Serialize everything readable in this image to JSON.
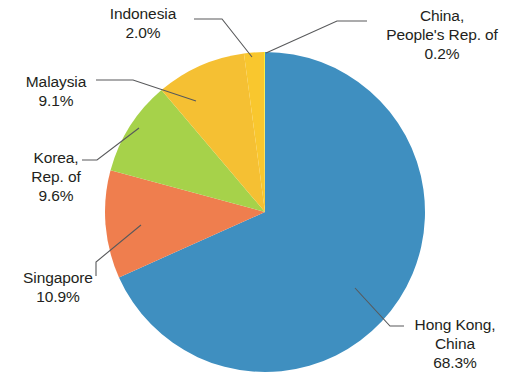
{
  "chart_data": {
    "type": "pie",
    "title": "",
    "subtitle": "",
    "xlabel": "",
    "ylabel": "",
    "legend_position": "none",
    "labels_position": "outside-with-leader-lines",
    "grid": false,
    "unit": "%",
    "categories": [
      "Hong Kong, China",
      "Singapore",
      "Korea, Rep. of",
      "Malaysia",
      "Indonesia",
      "China, People's Rep. of"
    ],
    "values": [
      68.3,
      10.9,
      9.6,
      9.1,
      2.0,
      0.2
    ],
    "colors": [
      "#3f8fc0",
      "#ef7e4e",
      "#a6d24a",
      "#f5c033",
      "#f9c72e",
      "#f8ec38"
    ],
    "slices": [
      {
        "name": "Hong Kong, China",
        "name_lines": [
          "Hong Kong,",
          "China"
        ],
        "value": 68.3,
        "value_label": "68.3%",
        "color": "#3f8fc0",
        "start_angle": 0.0,
        "end_angle": 245.88
      },
      {
        "name": "Singapore",
        "name_lines": [
          "Singapore"
        ],
        "value": 10.9,
        "value_label": "10.9%",
        "color": "#ef7e4e",
        "start_angle": 245.88,
        "end_angle": 285.12
      },
      {
        "name": "Korea, Rep. of",
        "name_lines": [
          "Korea,",
          "Rep. of"
        ],
        "value": 9.6,
        "value_label": "9.6%",
        "color": "#a6d24a",
        "start_angle": 285.12,
        "end_angle": 319.68
      },
      {
        "name": "Malaysia",
        "name_lines": [
          "Malaysia"
        ],
        "value": 9.1,
        "value_label": "9.1%",
        "color": "#f5c033",
        "start_angle": 319.68,
        "end_angle": 352.44
      },
      {
        "name": "Indonesia",
        "name_lines": [
          "Indonesia"
        ],
        "value": 2.0,
        "value_label": "2.0%",
        "color": "#f9c72e",
        "start_angle": 352.44,
        "end_angle": 359.64
      },
      {
        "name": "China, People's Rep. of",
        "name_lines": [
          "China,",
          "People's Rep. of"
        ],
        "value": 0.2,
        "value_label": "0.2%",
        "color": "#f8ec38",
        "start_angle": 359.64,
        "end_angle": 360.0
      }
    ]
  },
  "labels": {
    "indonesia": {
      "line1": "Indonesia",
      "pct": "2.0%"
    },
    "china": {
      "line1": "China,",
      "line2": "People's Rep. of",
      "pct": "0.2%"
    },
    "malaysia": {
      "line1": "Malaysia",
      "pct": "9.1%"
    },
    "korea": {
      "line1": "Korea,",
      "line2": "Rep. of",
      "pct": "9.6%"
    },
    "singapore": {
      "line1": "Singapore",
      "pct": "10.9%"
    },
    "hongkong": {
      "line1": "Hong Kong,",
      "line2": "China",
      "pct": "68.3%"
    }
  },
  "geometry": {
    "center_x": 265,
    "center_y": 212,
    "radius": 160
  },
  "style": {
    "background": "#ffffff",
    "text_color": "#231f20",
    "leader_line_color": "#58595b"
  }
}
